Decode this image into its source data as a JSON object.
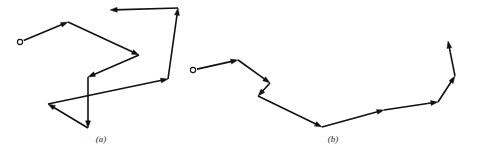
{
  "figure": {
    "title": "",
    "width": 480,
    "height": 160,
    "background_color": "#ffffff",
    "stroke_color": "#111111",
    "stroke_width": 1.6,
    "marker": {
      "type": "open-circle",
      "radius": 2.6,
      "fill": "#ffffff",
      "stroke": "#111111",
      "stroke_width": 1.1
    }
  },
  "chart_data": {
    "type": "line",
    "title": "",
    "xlabel": "",
    "ylabel": "",
    "grid": false,
    "legend": null,
    "series": [
      {
        "name": "(a)",
        "caption": "(a)",
        "start_marker": {
          "x": 20,
          "y": 42
        },
        "arrowheads": "every segment end",
        "points": [
          {
            "x": 20,
            "y": 42
          },
          {
            "x": 68,
            "y": 22
          },
          {
            "x": 139,
            "y": 55
          },
          {
            "x": 88,
            "y": 77
          },
          {
            "x": 88,
            "y": 128
          },
          {
            "x": 48,
            "y": 104
          },
          {
            "x": 168,
            "y": 79
          },
          {
            "x": 178,
            "y": 8
          },
          {
            "x": 110,
            "y": 10
          }
        ]
      },
      {
        "name": "(b)",
        "caption": "(b)",
        "start_marker": {
          "x": 193,
          "y": 70
        },
        "arrowheads": "every segment end",
        "points": [
          {
            "x": 193,
            "y": 70
          },
          {
            "x": 238,
            "y": 60
          },
          {
            "x": 270,
            "y": 83
          },
          {
            "x": 258,
            "y": 96
          },
          {
            "x": 322,
            "y": 127
          },
          {
            "x": 384,
            "y": 110
          },
          {
            "x": 438,
            "y": 102
          },
          {
            "x": 455,
            "y": 76
          },
          {
            "x": 448,
            "y": 41
          }
        ]
      }
    ],
    "xlim": [
      0,
      480
    ],
    "ylim": [
      160,
      0
    ]
  },
  "captions": {
    "panel_a": "(a)",
    "panel_b": "(b)"
  }
}
